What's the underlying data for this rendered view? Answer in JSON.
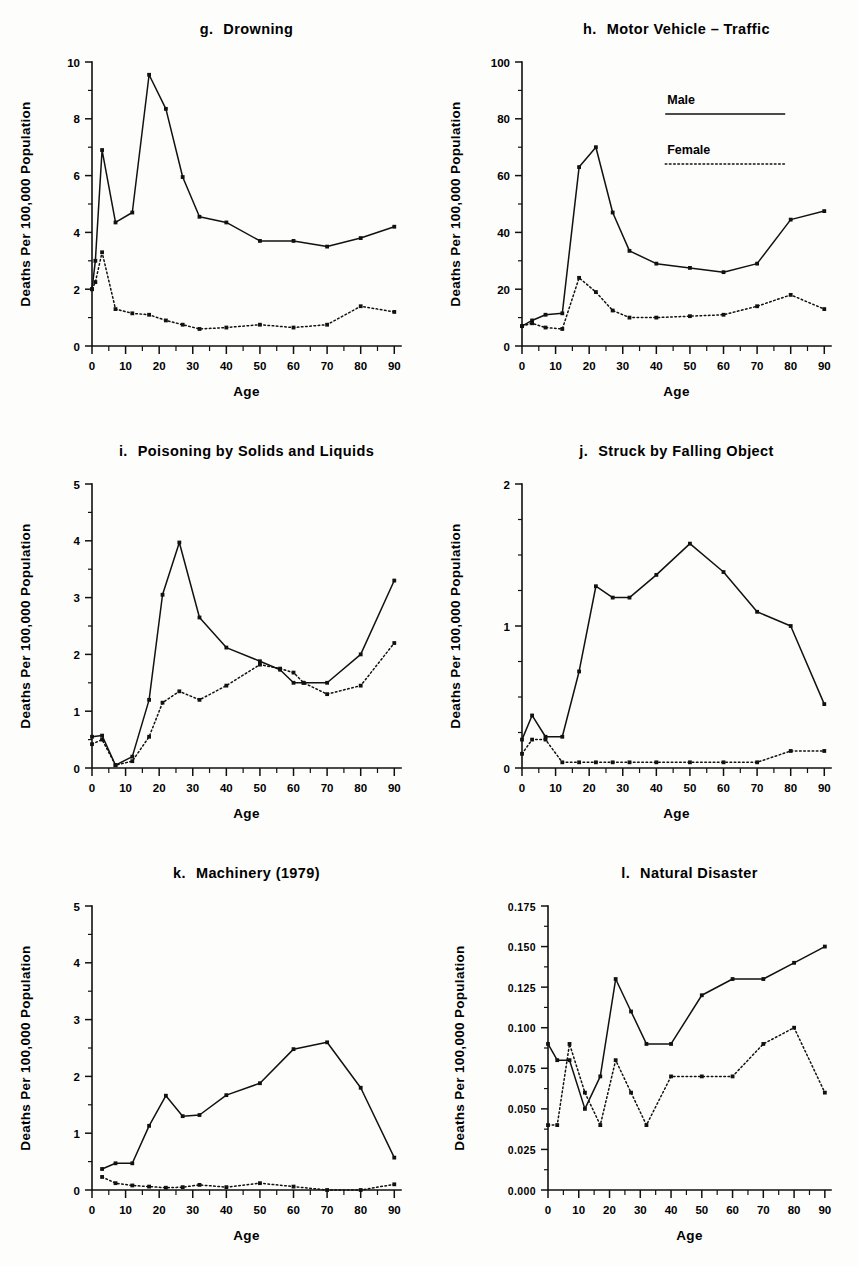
{
  "figure": {
    "axis_y_label": "Deaths Per 100,000 Population",
    "axis_x_label": "Age",
    "legend": {
      "male_label": "Male",
      "female_label": "Female"
    },
    "colors": {
      "ink": "#111111",
      "paper": "#fdfdfc"
    }
  },
  "panels": [
    {
      "letter": "g.",
      "title": "Drowning",
      "ylim": [
        0,
        10
      ],
      "yticks": [
        "0",
        "2",
        "4",
        "6",
        "8",
        "10"
      ],
      "ytick_values": [
        0,
        2,
        4,
        6,
        8,
        10
      ],
      "yminor_step": 1,
      "has_legend": false
    },
    {
      "letter": "h.",
      "title": "Motor Vehicle – Traffic",
      "ylim": [
        0,
        100
      ],
      "yticks": [
        "0",
        "20",
        "40",
        "60",
        "80",
        "100"
      ],
      "ytick_values": [
        0,
        20,
        40,
        60,
        80,
        100
      ],
      "yminor_step": 10,
      "has_legend": true
    },
    {
      "letter": "i.",
      "title": "Poisoning by Solids and Liquids",
      "ylim": [
        0,
        5
      ],
      "yticks": [
        "0",
        "1",
        "2",
        "3",
        "4",
        "5"
      ],
      "ytick_values": [
        0,
        1,
        2,
        3,
        4,
        5
      ],
      "yminor_step": 0.5,
      "has_legend": false
    },
    {
      "letter": "j.",
      "title": "Struck by Falling Object",
      "ylim": [
        0,
        2
      ],
      "yticks": [
        "0",
        "1",
        "2"
      ],
      "ytick_values": [
        0,
        1,
        2
      ],
      "yminor_step": 0.25,
      "has_legend": false
    },
    {
      "letter": "k.",
      "title": "Machinery (1979)",
      "ylim": [
        0,
        5
      ],
      "yticks": [
        "0",
        "1",
        "2",
        "3",
        "4",
        "5"
      ],
      "ytick_values": [
        0,
        1,
        2,
        3,
        4,
        5
      ],
      "yminor_step": 0.5,
      "has_legend": false
    },
    {
      "letter": "l.",
      "title": "Natural Disaster",
      "ylim": [
        0,
        0.175
      ],
      "yticks": [
        "0.000",
        "0.025",
        "0.050",
        "0.075",
        "0.100",
        "0.125",
        "0.150",
        "0.175"
      ],
      "ytick_values": [
        0,
        0.025,
        0.05,
        0.075,
        0.1,
        0.125,
        0.15,
        0.175
      ],
      "yminor_step": 0.0125,
      "has_legend": false
    }
  ],
  "chart_data": [
    {
      "type": "line",
      "title": "g.  Drowning",
      "xlabel": "Age",
      "ylabel": "Deaths Per 100,000 Population",
      "xlim": [
        0,
        92
      ],
      "ylim": [
        0,
        10
      ],
      "xticks": [
        0,
        10,
        20,
        30,
        40,
        50,
        60,
        70,
        80,
        90
      ],
      "xtick_labels": [
        "0",
        "10",
        "20",
        "30",
        "40",
        "50",
        "60",
        "70",
        "80",
        "90"
      ],
      "grid": false,
      "legend_position": "none",
      "x": [
        0,
        1,
        3,
        7,
        12,
        17,
        22,
        27,
        32,
        40,
        50,
        60,
        70,
        80,
        90
      ],
      "series": [
        {
          "name": "Male",
          "style": "solid",
          "values": [
            2.0,
            3.0,
            6.9,
            4.35,
            4.7,
            9.55,
            8.35,
            5.95,
            4.55,
            4.35,
            3.7,
            3.7,
            3.5,
            3.8,
            4.2
          ]
        },
        {
          "name": "Female",
          "style": "dotted",
          "values": [
            2.0,
            2.25,
            3.3,
            1.3,
            1.15,
            1.1,
            0.9,
            0.75,
            0.6,
            0.65,
            0.75,
            0.65,
            0.75,
            1.4,
            1.2
          ]
        }
      ]
    },
    {
      "type": "line",
      "title": "h.  Motor Vehicle – Traffic",
      "xlabel": "Age",
      "ylabel": "Deaths Per 100,000 Population",
      "xlim": [
        0,
        92
      ],
      "ylim": [
        0,
        100
      ],
      "xticks": [
        0,
        10,
        20,
        30,
        40,
        50,
        60,
        70,
        80,
        90
      ],
      "xtick_labels": [
        "0",
        "10",
        "20",
        "30",
        "40",
        "50",
        "60",
        "70",
        "80",
        "90"
      ],
      "grid": false,
      "legend_position": "upper-right",
      "x": [
        0,
        3,
        7,
        12,
        17,
        22,
        27,
        32,
        40,
        50,
        60,
        70,
        80,
        90
      ],
      "series": [
        {
          "name": "Male",
          "style": "solid",
          "values": [
            7.0,
            9.0,
            11.0,
            11.5,
            63.0,
            70.0,
            47.0,
            33.5,
            29.0,
            27.5,
            26.0,
            29.0,
            44.5,
            47.5
          ]
        },
        {
          "name": "Female",
          "style": "dotted",
          "values": [
            7.0,
            8.0,
            6.5,
            6.0,
            24.0,
            19.0,
            12.5,
            10.0,
            10.0,
            10.5,
            11.0,
            14.0,
            18.0,
            13.0
          ]
        }
      ]
    },
    {
      "type": "line",
      "title": "i.  Poisoning by Solids and Liquids",
      "xlabel": "Age",
      "ylabel": "Deaths Per 100,000 Population",
      "xlim": [
        0,
        92
      ],
      "ylim": [
        0,
        5
      ],
      "xticks": [
        0,
        10,
        20,
        30,
        40,
        50,
        60,
        70,
        80,
        90
      ],
      "xtick_labels": [
        "0",
        "10",
        "20",
        "30",
        "40",
        "50",
        "60",
        "70",
        "80",
        "90"
      ],
      "grid": false,
      "legend_position": "none",
      "x": [
        0,
        3,
        7,
        12,
        17,
        21,
        26,
        32,
        40,
        50,
        56,
        60,
        63,
        70,
        80,
        90
      ],
      "series": [
        {
          "name": "Male",
          "style": "solid",
          "values": [
            0.55,
            0.57,
            0.05,
            0.2,
            1.2,
            3.05,
            3.97,
            2.65,
            2.12,
            1.88,
            1.73,
            1.5,
            1.5,
            1.5,
            2.0,
            3.3
          ]
        },
        {
          "name": "Female",
          "style": "dotted",
          "values": [
            0.42,
            0.5,
            0.05,
            0.12,
            0.55,
            1.15,
            1.35,
            1.2,
            1.45,
            1.82,
            1.75,
            1.68,
            1.5,
            1.3,
            1.45,
            2.2
          ]
        }
      ]
    },
    {
      "type": "line",
      "title": "j.  Struck by Falling Object",
      "xlabel": "Age",
      "ylabel": "Deaths Per 100,000 Population",
      "xlim": [
        0,
        92
      ],
      "ylim": [
        0,
        2
      ],
      "xticks": [
        0,
        10,
        20,
        30,
        40,
        50,
        60,
        70,
        80,
        90
      ],
      "xtick_labels": [
        "0",
        "10",
        "20",
        "30",
        "40",
        "50",
        "60",
        "70",
        "80",
        "90"
      ],
      "grid": false,
      "legend_position": "none",
      "x": [
        0,
        3,
        7,
        12,
        17,
        22,
        27,
        32,
        40,
        50,
        60,
        70,
        80,
        90
      ],
      "series": [
        {
          "name": "Male",
          "style": "solid",
          "values": [
            0.2,
            0.37,
            0.22,
            0.22,
            0.68,
            1.28,
            1.2,
            1.2,
            1.36,
            1.58,
            1.38,
            1.1,
            1.0,
            0.45
          ]
        },
        {
          "name": "Female",
          "style": "dotted",
          "values": [
            0.1,
            0.2,
            0.2,
            0.04,
            0.04,
            0.04,
            0.04,
            0.04,
            0.04,
            0.04,
            0.04,
            0.04,
            0.12,
            0.12
          ]
        }
      ]
    },
    {
      "type": "line",
      "title": "k.  Machinery (1979)",
      "xlabel": "Age",
      "ylabel": "Deaths Per 100,000 Population",
      "xlim": [
        0,
        92
      ],
      "ylim": [
        0,
        5
      ],
      "xticks": [
        0,
        10,
        20,
        30,
        40,
        50,
        60,
        70,
        80,
        90
      ],
      "xtick_labels": [
        "0",
        "10",
        "20",
        "30",
        "40",
        "50",
        "60",
        "70",
        "80",
        "90"
      ],
      "grid": false,
      "legend_position": "none",
      "x": [
        3,
        7,
        12,
        17,
        22,
        27,
        32,
        40,
        50,
        60,
        70,
        80,
        90
      ],
      "series": [
        {
          "name": "Male",
          "style": "solid",
          "values": [
            0.37,
            0.47,
            0.47,
            1.13,
            1.66,
            1.3,
            1.32,
            1.67,
            1.88,
            2.48,
            2.6,
            1.8,
            0.57
          ]
        },
        {
          "name": "Female",
          "style": "dotted",
          "values": [
            0.23,
            0.12,
            0.08,
            0.06,
            0.04,
            0.05,
            0.09,
            0.05,
            0.12,
            0.06,
            0.0,
            0.0,
            0.1
          ]
        }
      ]
    },
    {
      "type": "line",
      "title": "l.  Natural Disaster",
      "xlabel": "Age",
      "ylabel": "Deaths Per 100,000 Population",
      "xlim": [
        0,
        92
      ],
      "ylim": [
        0,
        0.175
      ],
      "xticks": [
        0,
        10,
        20,
        30,
        40,
        50,
        60,
        70,
        80,
        90
      ],
      "xtick_labels": [
        "0",
        "10",
        "20",
        "30",
        "40",
        "50",
        "60",
        "70",
        "80",
        "90"
      ],
      "grid": false,
      "legend_position": "none",
      "x": [
        0,
        3,
        7,
        12,
        17,
        22,
        27,
        32,
        40,
        50,
        60,
        70,
        80,
        90
      ],
      "series": [
        {
          "name": "Male",
          "style": "solid",
          "values": [
            0.09,
            0.08,
            0.08,
            0.05,
            0.07,
            0.13,
            0.11,
            0.09,
            0.09,
            0.12,
            0.13,
            0.13,
            0.14,
            0.15
          ]
        },
        {
          "name": "Female",
          "style": "dotted",
          "values": [
            0.04,
            0.04,
            0.09,
            0.06,
            0.04,
            0.08,
            0.06,
            0.04,
            0.07,
            0.07,
            0.07,
            0.09,
            0.1,
            0.06
          ]
        }
      ]
    }
  ]
}
